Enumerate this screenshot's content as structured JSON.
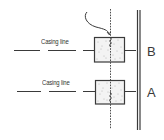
{
  "diagram": {
    "type": "casing-joint-marking-sketch",
    "colors": {
      "line": "#3a3a3a",
      "box_fill": "#f3f3f3",
      "stipple": "#777777"
    },
    "casing_lines": [
      {
        "id": "upper",
        "label": "Casing line",
        "y": 50
      },
      {
        "id": "lower",
        "label": "Casing line",
        "y": 91
      }
    ],
    "blocks": [
      {
        "id": "B",
        "label": "B",
        "x": 94,
        "y": 37,
        "w": 30,
        "h": 25
      },
      {
        "id": "A",
        "label": "A",
        "x": 95,
        "y": 80,
        "w": 29,
        "h": 24
      }
    ],
    "side_labels": [
      "B",
      "A"
    ],
    "elements": {
      "vertical_dashed_line": "centerline through both blocks",
      "curved_wire": "enters top of block B",
      "double_vertical_wall": "right-hand boundary"
    }
  }
}
